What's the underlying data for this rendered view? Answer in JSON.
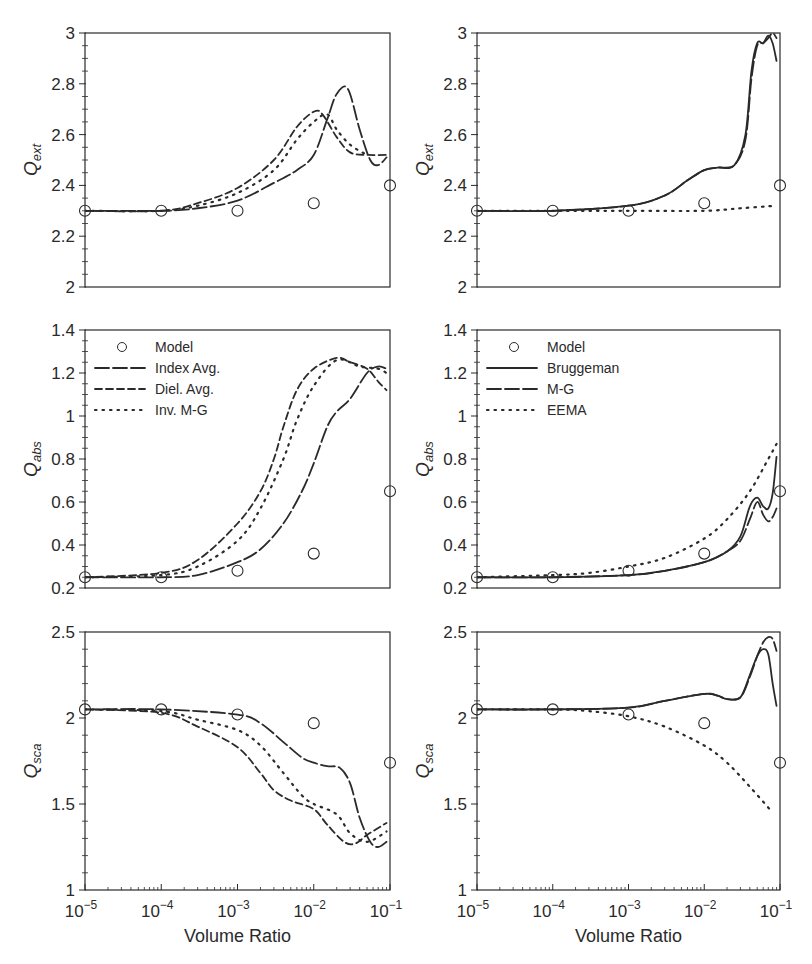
{
  "figure": {
    "xlabel": "Volume Ratio",
    "x_ticks": [
      "-5",
      "-4",
      "-3",
      "-2",
      "-1"
    ],
    "x_tick_base": "10",
    "colors": {
      "ink": "#2a2a2a",
      "background": "#ffffff"
    }
  },
  "chart_data": [
    {
      "id": "left-qext",
      "type": "line",
      "ylabel": "Q",
      "ylabel_sub": "ext",
      "xscale": "log",
      "xlim": [
        1e-05,
        0.1
      ],
      "ylim": [
        2,
        3
      ],
      "yticks": [
        "2",
        "2.2",
        "2.4",
        "2.6",
        "2.8",
        "3"
      ],
      "legend": null,
      "model": {
        "name": "Model",
        "x": [
          1e-05,
          0.0001,
          0.001,
          0.01,
          0.1
        ],
        "y": [
          2.3,
          2.3,
          2.3,
          2.33,
          2.4
        ]
      },
      "series": [
        {
          "name": "Index Avg.",
          "style": "longdash",
          "x": [
            1e-05,
            0.0001,
            0.0003,
            0.001,
            0.003,
            0.006,
            0.01,
            0.015,
            0.02,
            0.028,
            0.04,
            0.055,
            0.07,
            0.09
          ],
          "y": [
            2.3,
            2.3,
            2.31,
            2.34,
            2.41,
            2.46,
            2.52,
            2.66,
            2.76,
            2.78,
            2.62,
            2.5,
            2.48,
            2.51
          ]
        },
        {
          "name": "Diel. Avg.",
          "style": "dash",
          "x": [
            1e-05,
            0.0001,
            0.0003,
            0.001,
            0.003,
            0.006,
            0.01,
            0.013,
            0.02,
            0.03,
            0.05,
            0.09
          ],
          "y": [
            2.3,
            2.3,
            2.33,
            2.39,
            2.5,
            2.63,
            2.69,
            2.68,
            2.59,
            2.53,
            2.52,
            2.52
          ]
        },
        {
          "name": "Inv. M-G",
          "style": "dot",
          "x": [
            1e-05,
            0.0001,
            0.0003,
            0.001,
            0.003,
            0.006,
            0.01,
            0.015,
            0.02,
            0.03,
            0.05
          ],
          "y": [
            2.3,
            2.3,
            2.32,
            2.37,
            2.46,
            2.58,
            2.65,
            2.68,
            2.62,
            2.56,
            2.52
          ]
        }
      ]
    },
    {
      "id": "right-qext",
      "type": "line",
      "ylabel": "Q",
      "ylabel_sub": "ext",
      "xscale": "log",
      "xlim": [
        1e-05,
        0.1
      ],
      "ylim": [
        2,
        3
      ],
      "yticks": [
        "2",
        "2.2",
        "2.4",
        "2.6",
        "2.8",
        "3"
      ],
      "legend": null,
      "model": {
        "name": "Model",
        "x": [
          1e-05,
          0.0001,
          0.001,
          0.01,
          0.1
        ],
        "y": [
          2.3,
          2.3,
          2.3,
          2.33,
          2.4
        ]
      },
      "series": [
        {
          "name": "Bruggeman",
          "style": "solid",
          "x": [
            1e-05,
            0.0001,
            0.001,
            0.003,
            0.006,
            0.01,
            0.015,
            0.025,
            0.035,
            0.042,
            0.05,
            0.06,
            0.07,
            0.08,
            0.09
          ],
          "y": [
            2.3,
            2.3,
            2.32,
            2.36,
            2.42,
            2.46,
            2.47,
            2.48,
            2.6,
            2.85,
            2.96,
            2.96,
            2.99,
            2.96,
            2.89
          ]
        },
        {
          "name": "M-G",
          "style": "longdash",
          "x": [
            1e-05,
            0.0001,
            0.001,
            0.003,
            0.006,
            0.01,
            0.015,
            0.025,
            0.035,
            0.042,
            0.05,
            0.06,
            0.07,
            0.08,
            0.09
          ],
          "y": [
            2.3,
            2.3,
            2.32,
            2.36,
            2.42,
            2.46,
            2.47,
            2.48,
            2.58,
            2.82,
            2.95,
            2.96,
            2.98,
            3.0,
            2.98
          ]
        },
        {
          "name": "EEMA",
          "style": "dot",
          "x": [
            1e-05,
            0.0001,
            0.001,
            0.01,
            0.03,
            0.09
          ],
          "y": [
            2.3,
            2.3,
            2.3,
            2.3,
            2.31,
            2.32
          ]
        }
      ]
    },
    {
      "id": "left-qabs",
      "type": "line",
      "ylabel": "Q",
      "ylabel_sub": "abs",
      "xscale": "log",
      "xlim": [
        1e-05,
        0.1
      ],
      "ylim": [
        0.2,
        1.4
      ],
      "yticks": [
        "0.2",
        "0.4",
        "0.6",
        "0.8",
        "1",
        "1.2",
        "1.4"
      ],
      "legend": {
        "position": "upper left",
        "entries": [
          "Model",
          "Index Avg.",
          "Diel. Avg.",
          "Inv. M-G"
        ]
      },
      "model": {
        "name": "Model",
        "x": [
          1e-05,
          0.0001,
          0.001,
          0.01,
          0.1
        ],
        "y": [
          0.25,
          0.25,
          0.28,
          0.36,
          0.65
        ]
      },
      "series": [
        {
          "name": "Index Avg.",
          "style": "longdash",
          "x": [
            1e-05,
            0.0001,
            0.0003,
            0.001,
            0.002,
            0.004,
            0.007,
            0.01,
            0.015,
            0.02,
            0.03,
            0.05,
            0.07,
            0.09
          ],
          "y": [
            0.25,
            0.25,
            0.26,
            0.32,
            0.38,
            0.5,
            0.65,
            0.78,
            0.95,
            1.02,
            1.08,
            1.2,
            1.23,
            1.22
          ]
        },
        {
          "name": "Diel. Avg.",
          "style": "dash",
          "x": [
            1e-05,
            0.0001,
            0.0003,
            0.001,
            0.002,
            0.003,
            0.004,
            0.006,
            0.01,
            0.02,
            0.03,
            0.05,
            0.07,
            0.09
          ],
          "y": [
            0.25,
            0.27,
            0.33,
            0.5,
            0.65,
            0.8,
            0.95,
            1.12,
            1.22,
            1.27,
            1.25,
            1.22,
            1.16,
            1.12
          ]
        },
        {
          "name": "Inv. M-G",
          "style": "dot",
          "x": [
            1e-05,
            0.0001,
            0.0003,
            0.001,
            0.002,
            0.004,
            0.006,
            0.01,
            0.02,
            0.04,
            0.07,
            0.09
          ],
          "y": [
            0.25,
            0.26,
            0.3,
            0.42,
            0.57,
            0.8,
            0.98,
            1.14,
            1.26,
            1.23,
            1.22,
            1.2
          ]
        }
      ]
    },
    {
      "id": "right-qabs",
      "type": "line",
      "ylabel": "Q",
      "ylabel_sub": "abs",
      "xscale": "log",
      "xlim": [
        1e-05,
        0.1
      ],
      "ylim": [
        0.2,
        1.4
      ],
      "yticks": [
        "0.2",
        "0.4",
        "0.6",
        "0.8",
        "1",
        "1.2",
        "1.4"
      ],
      "legend": {
        "position": "upper left",
        "entries": [
          "Model",
          "Bruggeman",
          "M-G",
          "EEMA"
        ]
      },
      "model": {
        "name": "Model",
        "x": [
          1e-05,
          0.0001,
          0.001,
          0.01,
          0.1
        ],
        "y": [
          0.25,
          0.25,
          0.28,
          0.36,
          0.65
        ]
      },
      "series": [
        {
          "name": "Bruggeman",
          "style": "solid",
          "x": [
            1e-05,
            0.0001,
            0.001,
            0.003,
            0.01,
            0.02,
            0.03,
            0.04,
            0.05,
            0.06,
            0.07,
            0.08,
            0.09
          ],
          "y": [
            0.25,
            0.25,
            0.26,
            0.28,
            0.32,
            0.37,
            0.44,
            0.58,
            0.62,
            0.58,
            0.57,
            0.64,
            0.81
          ]
        },
        {
          "name": "M-G",
          "style": "longdash",
          "x": [
            1e-05,
            0.0001,
            0.001,
            0.003,
            0.01,
            0.02,
            0.03,
            0.04,
            0.05,
            0.06,
            0.07,
            0.08,
            0.09
          ],
          "y": [
            0.25,
            0.25,
            0.26,
            0.28,
            0.32,
            0.37,
            0.42,
            0.52,
            0.6,
            0.54,
            0.51,
            0.53,
            0.57
          ]
        },
        {
          "name": "EEMA",
          "style": "dot",
          "x": [
            1e-05,
            0.0001,
            0.0003,
            0.001,
            0.003,
            0.01,
            0.02,
            0.04,
            0.07,
            0.09
          ],
          "y": [
            0.25,
            0.26,
            0.27,
            0.3,
            0.34,
            0.43,
            0.52,
            0.65,
            0.8,
            0.87
          ]
        }
      ]
    },
    {
      "id": "left-qsca",
      "type": "line",
      "ylabel": "Q",
      "ylabel_sub": "sca",
      "xscale": "log",
      "xlim": [
        1e-05,
        0.1
      ],
      "ylim": [
        1,
        2.5
      ],
      "yticks": [
        "1",
        "1.5",
        "2",
        "2.5"
      ],
      "legend": null,
      "model": {
        "name": "Model",
        "x": [
          1e-05,
          0.0001,
          0.001,
          0.01,
          0.1
        ],
        "y": [
          2.05,
          2.05,
          2.02,
          1.97,
          1.74
        ]
      },
      "series": [
        {
          "name": "Index Avg.",
          "style": "longdash",
          "x": [
            1e-05,
            0.0001,
            0.001,
            0.002,
            0.004,
            0.007,
            0.01,
            0.015,
            0.022,
            0.03,
            0.04,
            0.055,
            0.07,
            0.09
          ],
          "y": [
            2.05,
            2.05,
            2.02,
            1.97,
            1.86,
            1.77,
            1.74,
            1.72,
            1.71,
            1.62,
            1.42,
            1.28,
            1.25,
            1.28
          ]
        },
        {
          "name": "Diel. Avg.",
          "style": "dash",
          "x": [
            1e-05,
            0.0001,
            0.0003,
            0.001,
            0.002,
            0.003,
            0.005,
            0.01,
            0.015,
            0.025,
            0.035,
            0.05,
            0.09
          ],
          "y": [
            2.05,
            2.03,
            1.95,
            1.83,
            1.68,
            1.58,
            1.52,
            1.47,
            1.38,
            1.28,
            1.27,
            1.32,
            1.39
          ]
        },
        {
          "name": "Inv. M-G",
          "style": "dot",
          "x": [
            1e-05,
            0.0001,
            0.0003,
            0.001,
            0.002,
            0.004,
            0.007,
            0.01,
            0.02,
            0.03,
            0.05,
            0.09
          ],
          "y": [
            2.05,
            2.04,
            1.99,
            1.93,
            1.84,
            1.68,
            1.55,
            1.5,
            1.44,
            1.33,
            1.28,
            1.34
          ]
        }
      ]
    },
    {
      "id": "right-qsca",
      "type": "line",
      "ylabel": "Q",
      "ylabel_sub": "sca",
      "xscale": "log",
      "xlim": [
        1e-05,
        0.1
      ],
      "ylim": [
        1,
        2.5
      ],
      "yticks": [
        "1",
        "1.5",
        "2",
        "2.5"
      ],
      "legend": null,
      "model": {
        "name": "Model",
        "x": [
          1e-05,
          0.0001,
          0.001,
          0.01,
          0.1
        ],
        "y": [
          2.05,
          2.05,
          2.02,
          1.97,
          1.74
        ]
      },
      "series": [
        {
          "name": "Bruggeman",
          "style": "solid",
          "x": [
            1e-05,
            0.0001,
            0.001,
            0.003,
            0.01,
            0.015,
            0.02,
            0.03,
            0.04,
            0.05,
            0.06,
            0.07,
            0.08,
            0.09
          ],
          "y": [
            2.05,
            2.05,
            2.06,
            2.1,
            2.14,
            2.13,
            2.11,
            2.12,
            2.25,
            2.36,
            2.4,
            2.37,
            2.2,
            2.07
          ]
        },
        {
          "name": "M-G",
          "style": "longdash",
          "x": [
            1e-05,
            0.0001,
            0.001,
            0.003,
            0.01,
            0.015,
            0.02,
            0.03,
            0.04,
            0.05,
            0.06,
            0.07,
            0.08,
            0.09
          ],
          "y": [
            2.05,
            2.05,
            2.06,
            2.1,
            2.14,
            2.13,
            2.11,
            2.12,
            2.24,
            2.36,
            2.44,
            2.47,
            2.46,
            2.39
          ]
        },
        {
          "name": "EEMA",
          "style": "dot",
          "x": [
            1e-05,
            0.0001,
            0.0003,
            0.001,
            0.003,
            0.01,
            0.02,
            0.04,
            0.08
          ],
          "y": [
            2.05,
            2.05,
            2.04,
            2.01,
            1.95,
            1.84,
            1.74,
            1.6,
            1.45
          ]
        }
      ]
    }
  ]
}
